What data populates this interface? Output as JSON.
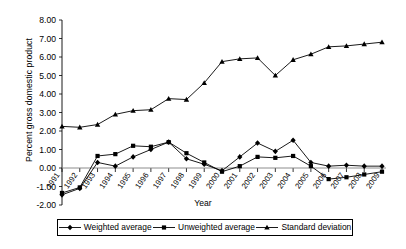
{
  "chart_data": {
    "type": "line",
    "title": "",
    "xlabel": "Year",
    "ylabel": "Percent gross domestic product",
    "categories": [
      "1991",
      "1992",
      "1993",
      "1994",
      "1995",
      "1996",
      "1997",
      "1998",
      "1999",
      "2000",
      "2001",
      "2002",
      "2003",
      "2004",
      "2005",
      "2006",
      "2007",
      "2008",
      "2009"
    ],
    "x": [
      1991,
      1992,
      1993,
      1994,
      1995,
      1996,
      1997,
      1998,
      1999,
      2000,
      2001,
      2002,
      2003,
      2004,
      2005,
      2006,
      2007,
      2008,
      2009
    ],
    "ylim": [
      -2.0,
      8.0
    ],
    "yticks": [
      "8.00",
      "7.00",
      "6.00",
      "5.00",
      "4.00",
      "3.00",
      "2.00",
      "1.00",
      "0.00",
      "-1.00",
      "-2.00"
    ],
    "ytick_values": [
      8.0,
      7.0,
      6.0,
      5.0,
      4.0,
      3.0,
      2.0,
      1.0,
      0.0,
      -1.0,
      -2.0
    ],
    "grid": false,
    "legend_position": "bottom",
    "series": [
      {
        "name": "Weighted average",
        "marker": "diamond",
        "color": "#000000",
        "values": [
          -1.45,
          -1.1,
          0.3,
          0.1,
          0.6,
          1.0,
          1.4,
          0.5,
          0.2,
          -0.15,
          0.6,
          1.35,
          0.9,
          1.5,
          0.3,
          0.1,
          0.15,
          0.1,
          0.1
        ]
      },
      {
        "name": "Unweighted average",
        "marker": "square",
        "color": "#000000",
        "values": [
          -1.35,
          -1.05,
          0.65,
          0.75,
          1.2,
          1.15,
          1.4,
          0.8,
          0.3,
          -0.2,
          0.1,
          0.6,
          0.55,
          0.65,
          0.1,
          -0.6,
          -0.5,
          -0.35,
          -0.2
        ]
      },
      {
        "name": "Standard deviation",
        "marker": "triangle",
        "color": "#000000",
        "values": [
          2.25,
          2.2,
          2.35,
          2.9,
          3.1,
          3.15,
          3.75,
          3.7,
          4.6,
          5.75,
          5.9,
          5.95,
          5.0,
          5.85,
          6.15,
          6.55,
          6.6,
          6.7,
          6.8
        ]
      }
    ]
  },
  "legend": {
    "entries": [
      {
        "label": "Weighted average"
      },
      {
        "label": "Unweighted average"
      },
      {
        "label": "Standard deviation"
      }
    ]
  }
}
